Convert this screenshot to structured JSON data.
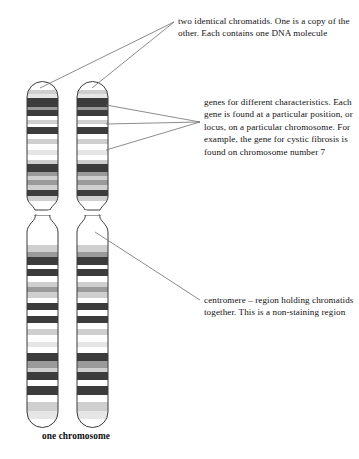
{
  "figure": {
    "caption": "one chromosome"
  },
  "annotations": {
    "chromatids": {
      "label": "chromatids-annotation",
      "text": "two identical chromatids. One is a copy of the other. Each contains one DNA molecule"
    },
    "genes": {
      "label": "genes-annotation",
      "text": "genes for different characteristics. Each gene is found at a particular position, or locus, on a particular chromosome. For example, the gene for cystic fibrosis is found on chromosome number 7"
    },
    "centromere": {
      "label": "centromere-annotation",
      "text": "centromere – region holding chromatids together. This is a non-staining region"
    }
  },
  "colors": {
    "outline": "#3a3a3a",
    "leader_line": "#6e6e6e",
    "band_dark": "#3c3c3c",
    "band_mid": "#9a9a9a",
    "band_light": "#cfcfcf",
    "band_pale": "#e6e6e6",
    "band_white": "#ffffff",
    "text": "#121212",
    "background": "#ffffff"
  },
  "chromatids": [
    {
      "name": "left-chromatid",
      "x": 27,
      "width": 31
    },
    {
      "name": "right-chromatid",
      "x": 77,
      "width": 31
    }
  ],
  "banding": {
    "upper_arm": [
      {
        "y": 0,
        "h": 9,
        "shade": "band_white"
      },
      {
        "y": 9,
        "h": 4,
        "shade": "band_light"
      },
      {
        "y": 13,
        "h": 4,
        "shade": "band_pale"
      },
      {
        "y": 17,
        "h": 9,
        "shade": "band_dark"
      },
      {
        "y": 26,
        "h": 3,
        "shade": "band_mid"
      },
      {
        "y": 29,
        "h": 6,
        "shade": "band_dark"
      },
      {
        "y": 35,
        "h": 4,
        "shade": "band_white"
      },
      {
        "y": 39,
        "h": 4,
        "shade": "band_light"
      },
      {
        "y": 43,
        "h": 3,
        "shade": "band_white"
      },
      {
        "y": 46,
        "h": 7,
        "shade": "band_dark"
      },
      {
        "y": 53,
        "h": 5,
        "shade": "band_white"
      },
      {
        "y": 58,
        "h": 5,
        "shade": "band_light"
      },
      {
        "y": 63,
        "h": 6,
        "shade": "band_white"
      },
      {
        "y": 69,
        "h": 5,
        "shade": "band_pale"
      },
      {
        "y": 74,
        "h": 5,
        "shade": "band_white"
      },
      {
        "y": 79,
        "h": 4,
        "shade": "band_light"
      },
      {
        "y": 83,
        "h": 8,
        "shade": "band_dark"
      },
      {
        "y": 91,
        "h": 4,
        "shade": "band_mid"
      },
      {
        "y": 95,
        "h": 4,
        "shade": "band_light"
      },
      {
        "y": 99,
        "h": 5,
        "shade": "band_mid"
      },
      {
        "y": 104,
        "h": 5,
        "shade": "band_light"
      },
      {
        "y": 109,
        "h": 6,
        "shade": "band_dark"
      },
      {
        "y": 115,
        "h": 5,
        "shade": "band_light"
      }
    ],
    "lower_arm": [
      {
        "y": 0,
        "h": 7,
        "shade": "band_light"
      },
      {
        "y": 7,
        "h": 5,
        "shade": "band_mid"
      },
      {
        "y": 12,
        "h": 8,
        "shade": "band_dark"
      },
      {
        "y": 20,
        "h": 4,
        "shade": "band_white"
      },
      {
        "y": 24,
        "h": 7,
        "shade": "band_dark"
      },
      {
        "y": 31,
        "h": 6,
        "shade": "band_white"
      },
      {
        "y": 37,
        "h": 5,
        "shade": "band_light"
      },
      {
        "y": 42,
        "h": 5,
        "shade": "band_mid"
      },
      {
        "y": 47,
        "h": 6,
        "shade": "band_light"
      },
      {
        "y": 53,
        "h": 5,
        "shade": "band_white"
      },
      {
        "y": 58,
        "h": 7,
        "shade": "band_dark"
      },
      {
        "y": 65,
        "h": 6,
        "shade": "band_white"
      },
      {
        "y": 71,
        "h": 7,
        "shade": "band_dark"
      },
      {
        "y": 78,
        "h": 6,
        "shade": "band_white"
      },
      {
        "y": 84,
        "h": 6,
        "shade": "band_light"
      },
      {
        "y": 90,
        "h": 7,
        "shade": "band_white"
      },
      {
        "y": 97,
        "h": 5,
        "shade": "band_pale"
      },
      {
        "y": 102,
        "h": 6,
        "shade": "band_white"
      },
      {
        "y": 108,
        "h": 8,
        "shade": "band_dark"
      },
      {
        "y": 116,
        "h": 7,
        "shade": "band_mid"
      },
      {
        "y": 123,
        "h": 4,
        "shade": "band_light"
      },
      {
        "y": 127,
        "h": 8,
        "shade": "band_dark"
      },
      {
        "y": 135,
        "h": 6,
        "shade": "band_white"
      },
      {
        "y": 141,
        "h": 9,
        "shade": "band_dark"
      },
      {
        "y": 150,
        "h": 7,
        "shade": "band_white"
      },
      {
        "y": 157,
        "h": 9,
        "shade": "band_light"
      },
      {
        "y": 166,
        "h": 8,
        "shade": "band_pale"
      }
    ]
  }
}
